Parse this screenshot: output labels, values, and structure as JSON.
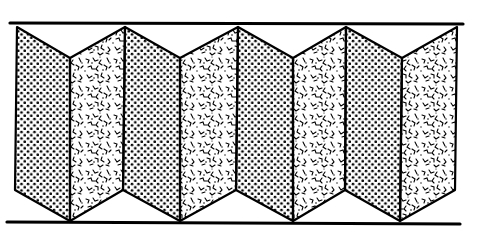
{
  "figure": {
    "type": "folding-screen-schematic",
    "panel_count": 8,
    "textures": [
      "dotted",
      "speckled",
      "dotted",
      "speckled",
      "dotted",
      "speckled",
      "dotted",
      "speckled"
    ],
    "colors": {
      "ink": "#000000",
      "background": "#ffffff"
    }
  },
  "rails": {
    "top": {
      "x1": 10,
      "x2": 463,
      "y": 23
    },
    "bottom": {
      "x1": 7,
      "x2": 460,
      "y": 223
    }
  },
  "panels": [
    {
      "texture": "dotted",
      "points": "17,27 70,58 70,221 15,190"
    },
    {
      "texture": "speckled",
      "points": "70,58 125,27 123,190 70,221"
    },
    {
      "texture": "dotted",
      "points": "125,27 180,58 180,221 123,190"
    },
    {
      "texture": "speckled",
      "points": "180,58 238,27 236,190 180,221"
    },
    {
      "texture": "dotted",
      "points": "238,27 293,58 293,221 236,190"
    },
    {
      "texture": "speckled",
      "points": "293,58 346,27 345,190 293,221"
    },
    {
      "texture": "dotted",
      "points": "346,27 402,58 400,221 345,190"
    },
    {
      "texture": "speckled",
      "points": "402,58 457,27 455,190 400,221"
    }
  ]
}
